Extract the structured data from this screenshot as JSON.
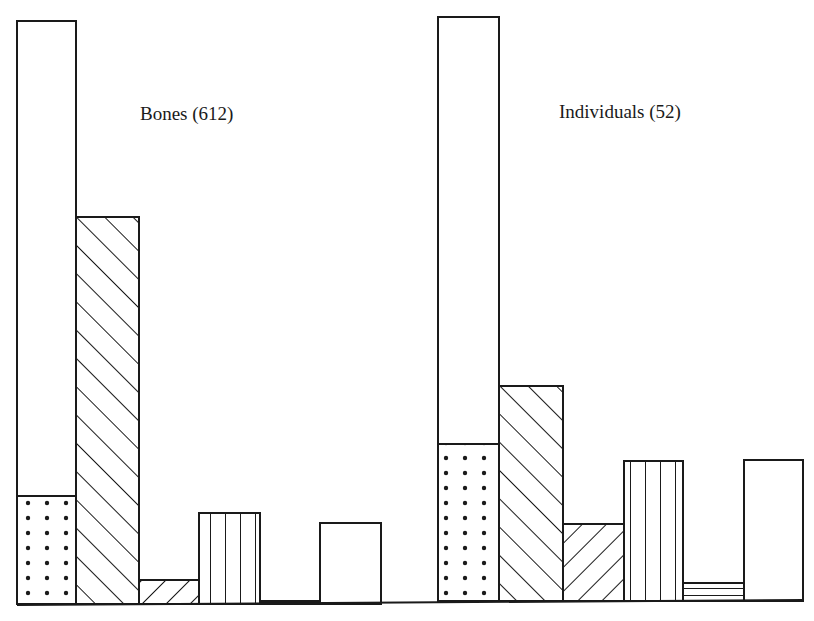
{
  "chart_data": {
    "type": "bar",
    "title": "",
    "xlabel": "",
    "ylabel": "",
    "grid": false,
    "legend": null,
    "note": "Two side-by-side panels of relative-height bars with no axis ticks; values are bar heights in pixels above the baseline. Bar 1 in each panel is a stacked bar: plain upper segment over dotted lower segment.",
    "categories": [
      "Bar 1 (stacked: plain over dotted)",
      "Bar 2 (diagonal hatch /)",
      "Bar 3 (diagonal hatch \\)",
      "Bar 4 (vertical lines)",
      "Bar 5 (horizontal lines)",
      "Bar 6 (plain)"
    ],
    "panels": [
      {
        "label": "Bones (612)",
        "n": 612,
        "baseline_y": 604,
        "bars": [
          {
            "pattern": "plain",
            "x": 17,
            "width": 59,
            "height": 583,
            "segments": [
              {
                "pattern": "dots",
                "height": 108
              },
              {
                "pattern": "plain",
                "height": 475
              }
            ]
          },
          {
            "pattern": "hatch-forward",
            "x": 76,
            "width": 63,
            "height": 387
          },
          {
            "pattern": "hatch-back",
            "x": 139,
            "width": 60,
            "height": 24
          },
          {
            "pattern": "vertical-lines",
            "x": 199,
            "width": 61,
            "height": 91
          },
          {
            "pattern": "horizontal-lines",
            "x": 260,
            "width": 60,
            "height": 3
          },
          {
            "pattern": "plain",
            "x": 320,
            "width": 61,
            "height": 81
          }
        ]
      },
      {
        "label": "Individuals (52)",
        "n": 52,
        "baseline_y": 601,
        "bars": [
          {
            "pattern": "plain",
            "x": 438,
            "width": 61,
            "height": 584,
            "segments": [
              {
                "pattern": "dots",
                "height": 157
              },
              {
                "pattern": "plain",
                "height": 427
              }
            ]
          },
          {
            "pattern": "hatch-forward",
            "x": 499,
            "width": 64,
            "height": 215
          },
          {
            "pattern": "hatch-back",
            "x": 563,
            "width": 61,
            "height": 77
          },
          {
            "pattern": "vertical-lines",
            "x": 624,
            "width": 59,
            "height": 140
          },
          {
            "pattern": "horizontal-lines",
            "x": 683,
            "width": 61,
            "height": 18
          },
          {
            "pattern": "plain",
            "x": 744,
            "width": 59,
            "height": 141
          }
        ]
      }
    ],
    "series": [
      {
        "name": "Bones (612)",
        "values": [
          583,
          387,
          24,
          91,
          3,
          81
        ],
        "dotted_segment_bar1": 108
      },
      {
        "name": "Individuals (52)",
        "values": [
          584,
          215,
          77,
          140,
          18,
          141
        ],
        "dotted_segment_bar1": 157
      }
    ]
  },
  "labels": {
    "bones": "Bones (612)",
    "individuals": "Individuals (52)"
  },
  "colors": {
    "ink": "#1a1a1a",
    "paper": "#ffffff"
  }
}
